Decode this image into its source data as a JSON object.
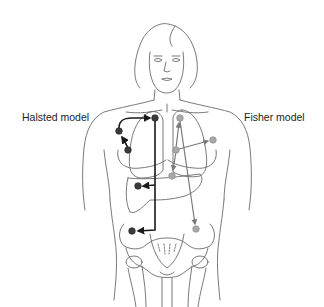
{
  "labels": {
    "halsted": "Halsted model",
    "fisher": "Fisher model"
  },
  "colors": {
    "outline": "#6a6a6a",
    "halsted_node": "#3a3a3a",
    "halsted_arrow": "#1a1a1a",
    "fisher_node": "#a8a8a8",
    "fisher_arrow": "#7a7a7a",
    "background": "#ffffff"
  },
  "figure": {
    "halsted_nodes": [
      {
        "id": "primary-breast",
        "x": 155,
        "y": 118
      },
      {
        "id": "axillary-upper",
        "x": 119,
        "y": 131
      },
      {
        "id": "axillary-lower",
        "x": 128,
        "y": 150
      },
      {
        "id": "liver",
        "x": 138,
        "y": 186
      },
      {
        "id": "pelvis",
        "x": 132,
        "y": 231
      }
    ],
    "fisher_nodes": [
      {
        "id": "primary-breast",
        "x": 176,
        "y": 150
      },
      {
        "id": "lung",
        "x": 180,
        "y": 118
      },
      {
        "id": "axilla",
        "x": 213,
        "y": 140
      },
      {
        "id": "liver",
        "x": 172,
        "y": 176
      },
      {
        "id": "pelvis",
        "x": 196,
        "y": 229
      }
    ]
  }
}
